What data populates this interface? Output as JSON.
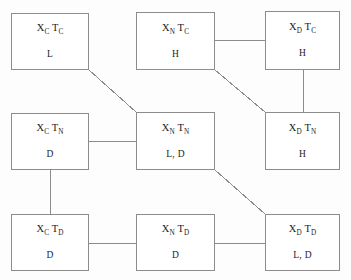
{
  "diagram": {
    "type": "grid-node-graph",
    "canvas": {
      "width": 351,
      "height": 280,
      "background": "#fdfdfd"
    },
    "style": {
      "box_border_color": "#8c8c8c",
      "edge_color": "#8c8c8c",
      "text_color": "#1c1c1c"
    },
    "row_labels": [
      "T_C",
      "T_N",
      "T_D"
    ],
    "column_labels": [
      "X_C",
      "X_N",
      "X_D"
    ],
    "nodes": [
      {
        "id": "xc-tc",
        "title_main": "X",
        "title_sub1": "C",
        "title_mid": " T",
        "title_sub2": "C",
        "title_plain": "X_C T_C",
        "value": "L",
        "x": 11,
        "y": 13,
        "w": 78,
        "h": 57
      },
      {
        "id": "xn-tc",
        "title_main": "X",
        "title_sub1": "N",
        "title_mid": " T",
        "title_sub2": "C",
        "title_plain": "X_N T_C",
        "value": "H",
        "x": 136,
        "y": 12,
        "w": 79,
        "h": 58
      },
      {
        "id": "xd-tc",
        "title_main": "X",
        "title_sub1": "D",
        "title_mid": " T",
        "title_sub2": "C",
        "title_plain": "X_D T_C",
        "value": "H",
        "x": 265,
        "y": 11,
        "w": 75,
        "h": 59
      },
      {
        "id": "xc-tn",
        "title_main": "X",
        "title_sub1": "C",
        "title_mid": " T",
        "title_sub2": "N",
        "title_plain": "X_C T_N",
        "value": "D",
        "x": 11,
        "y": 113,
        "w": 78,
        "h": 57
      },
      {
        "id": "xn-tn",
        "title_main": "X",
        "title_sub1": "N",
        "title_mid": " T",
        "title_sub2": "N",
        "title_plain": "X_N T_N",
        "value": "L, D",
        "x": 136,
        "y": 112,
        "w": 79,
        "h": 58
      },
      {
        "id": "xd-tn",
        "title_main": "X",
        "title_sub1": "D",
        "title_mid": " T",
        "title_sub2": "N",
        "title_plain": "X_D T_N",
        "value": "H",
        "x": 265,
        "y": 112,
        "w": 75,
        "h": 58
      },
      {
        "id": "xc-td",
        "title_main": "X",
        "title_sub1": "C",
        "title_mid": " T",
        "title_sub2": "D",
        "title_plain": "X_C T_D",
        "value": "D",
        "x": 11,
        "y": 214,
        "w": 78,
        "h": 57
      },
      {
        "id": "xn-td",
        "title_main": "X",
        "title_sub1": "N",
        "title_mid": " T",
        "title_sub2": "D",
        "title_plain": "X_N T_D",
        "value": "D",
        "x": 136,
        "y": 214,
        "w": 79,
        "h": 57
      },
      {
        "id": "xd-td",
        "title_main": "X",
        "title_sub1": "D",
        "title_mid": " T",
        "title_sub2": "D",
        "title_plain": "X_D T_D",
        "value": "L, D",
        "x": 265,
        "y": 214,
        "w": 75,
        "h": 57
      }
    ],
    "edges": [
      {
        "id": "edge-xctc-xntn",
        "from": "xc-tc",
        "to": "xn-tn",
        "kind": "diagonal",
        "x1": 89,
        "y1": 70,
        "x2": 136,
        "y2": 112
      },
      {
        "id": "edge-xntc-xdtc",
        "from": "xn-tc",
        "to": "xd-tc",
        "kind": "horizontal",
        "x1": 215,
        "y1": 40,
        "x2": 265,
        "y2": 40
      },
      {
        "id": "edge-xntc-xdtn",
        "from": "xn-tc",
        "to": "xd-tn",
        "kind": "diagonal",
        "x1": 215,
        "y1": 70,
        "x2": 265,
        "y2": 112
      },
      {
        "id": "edge-xdtc-xdtn",
        "from": "xd-tc",
        "to": "xd-tn",
        "kind": "vertical",
        "x1": 303,
        "y1": 70,
        "x2": 303,
        "y2": 112
      },
      {
        "id": "edge-xctn-xntn",
        "from": "xc-tn",
        "to": "xn-tn",
        "kind": "horizontal",
        "x1": 89,
        "y1": 141,
        "x2": 136,
        "y2": 141
      },
      {
        "id": "edge-xctn-xctd",
        "from": "xc-tn",
        "to": "xc-td",
        "kind": "vertical",
        "x1": 50,
        "y1": 170,
        "x2": 50,
        "y2": 214
      },
      {
        "id": "edge-xntn-xdtd",
        "from": "xn-tn",
        "to": "xd-td",
        "kind": "diagonal",
        "x1": 215,
        "y1": 170,
        "x2": 265,
        "y2": 214
      },
      {
        "id": "edge-xctd-xntd",
        "from": "xc-td",
        "to": "xn-td",
        "kind": "horizontal",
        "x1": 89,
        "y1": 243,
        "x2": 136,
        "y2": 243
      },
      {
        "id": "edge-xntd-xdtd",
        "from": "xn-td",
        "to": "xd-td",
        "kind": "horizontal",
        "x1": 215,
        "y1": 243,
        "x2": 265,
        "y2": 243
      }
    ]
  }
}
